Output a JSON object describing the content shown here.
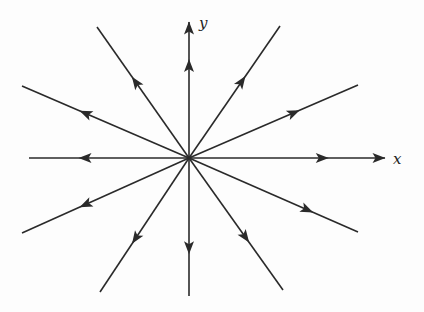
{
  "diagram": {
    "type": "phase-portrait",
    "origin": [
      189,
      158
    ],
    "axes": {
      "x_label": "x",
      "y_label": "y"
    },
    "rays": [
      {
        "id": "pos-x-axis",
        "end": [
          385,
          158
        ],
        "arrow_at": 0.68,
        "direction": "outward"
      },
      {
        "id": "neg-x-axis",
        "end": [
          29,
          158
        ],
        "arrow_at": 0.65,
        "direction": "outward"
      },
      {
        "id": "pos-y-axis",
        "end": [
          189,
          22
        ],
        "arrow_at": 0.68,
        "direction": "outward"
      },
      {
        "id": "neg-y-axis",
        "end": [
          189,
          296
        ],
        "arrow_at": 0.65,
        "direction": "outward"
      },
      {
        "id": "upper-left-steep",
        "end": [
          97,
          27
        ],
        "arrow_at": 0.58,
        "direction": "outward"
      },
      {
        "id": "upper-left-shallow",
        "end": [
          22,
          86
        ],
        "arrow_at": 0.62,
        "direction": "outward"
      },
      {
        "id": "upper-right-steep",
        "end": [
          280,
          26
        ],
        "arrow_at": 0.58,
        "direction": "outward"
      },
      {
        "id": "upper-right-shallow",
        "end": [
          358,
          85
        ],
        "arrow_at": 0.62,
        "direction": "outward"
      },
      {
        "id": "lower-left-shallow",
        "end": [
          22,
          233
        ],
        "arrow_at": 0.62,
        "direction": "outward"
      },
      {
        "id": "lower-left-steep",
        "end": [
          100,
          292
        ],
        "arrow_at": 0.6,
        "direction": "outward"
      },
      {
        "id": "lower-right-steep",
        "end": [
          283,
          290
        ],
        "arrow_at": 0.6,
        "direction": "outward"
      },
      {
        "id": "lower-right-shallow",
        "end": [
          358,
          232
        ],
        "arrow_at": 0.7,
        "direction": "outward"
      }
    ],
    "colors": {
      "line": "#2a2a2a",
      "background": "#fdfdfd"
    }
  }
}
